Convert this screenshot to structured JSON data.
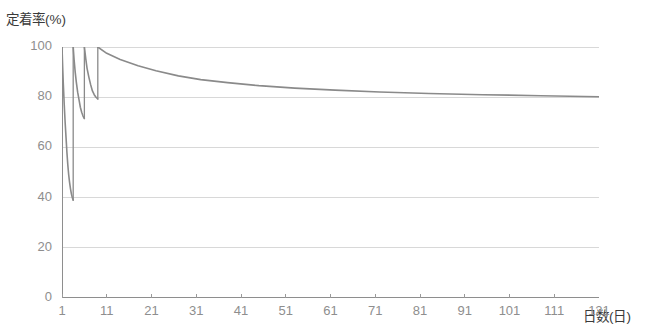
{
  "chart_data": {
    "type": "line",
    "title": "",
    "xlabel": "日数(日)",
    "ylabel": "定着率(%)",
    "xlim": [
      1,
      121
    ],
    "ylim": [
      0,
      100
    ],
    "yticks": [
      0,
      20,
      40,
      60,
      80,
      100
    ],
    "xticks": [
      1,
      11,
      21,
      31,
      41,
      51,
      61,
      71,
      81,
      91,
      101,
      111,
      121
    ],
    "grid": true,
    "grid_axis": "y",
    "legend": "none",
    "line_color": "#8a8a8a",
    "series": [
      {
        "name": "定着率",
        "segments": [
          {
            "name": "decay-1",
            "x": [
              1.0,
              1.15,
              1.3,
              1.5,
              1.7,
              1.9,
              2.1,
              2.3,
              2.5,
              2.7,
              2.9,
              3.1,
              3.3,
              3.5
            ],
            "y": [
              100,
              92,
              85,
              77,
              70,
              64,
              58,
              53,
              49,
              46,
              43.5,
              41.5,
              40,
              39
            ]
          },
          {
            "name": "jump-1",
            "x": [
              3.5,
              3.5
            ],
            "y": [
              39,
              100
            ]
          },
          {
            "name": "decay-2",
            "x": [
              3.5,
              3.7,
              3.95,
              4.2,
              4.5,
              4.8,
              5.1,
              5.4,
              5.7,
              6.0
            ],
            "y": [
              100,
              95,
              90,
              86,
              82,
              79,
              76,
              74,
              72.5,
              71.5
            ]
          },
          {
            "name": "jump-2",
            "x": [
              6.0,
              6.0
            ],
            "y": [
              71.5,
              100
            ]
          },
          {
            "name": "decay-3",
            "x": [
              6.0,
              6.3,
              6.6,
              7.0,
              7.4,
              7.8,
              8.2,
              8.6,
              9.0
            ],
            "y": [
              100,
              95.5,
              91.5,
              88,
              85,
              82.5,
              81,
              80,
              79.3
            ]
          },
          {
            "name": "jump-3",
            "x": [
              9.0,
              9.0
            ],
            "y": [
              79.3,
              100
            ]
          },
          {
            "name": "decay-4",
            "x": [
              9.0,
              11,
              14,
              18,
              22,
              27,
              32,
              38,
              45,
              53,
              62,
              72,
              83,
              95,
              108,
              121
            ],
            "y": [
              100,
              97.5,
              95,
              92.5,
              90.5,
              88.5,
              87,
              85.8,
              84.6,
              83.6,
              82.8,
              82.1,
              81.5,
              81.0,
              80.6,
              80.2
            ]
          }
        ]
      }
    ]
  },
  "axes": {
    "ylabel_text": "定着率(%)",
    "xlabel_text": "日数(日)",
    "ytick_labels": [
      "100",
      "80",
      "60",
      "40",
      "20",
      "0"
    ],
    "xtick_labels": [
      "1",
      "11",
      "21",
      "31",
      "41",
      "51",
      "61",
      "71",
      "81",
      "91",
      "101",
      "111",
      "121"
    ]
  },
  "title_strip": ""
}
